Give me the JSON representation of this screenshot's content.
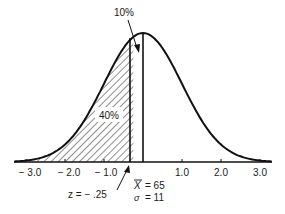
{
  "chart_data": {
    "type": "area",
    "title": "",
    "x_ticks": [
      "-3.0",
      "-2.0",
      "-1.0",
      "1.0",
      "2.0",
      "3.0"
    ],
    "x_tick_values": [
      -3,
      -2,
      -1,
      1,
      2,
      3
    ],
    "xlim": [
      -3.3,
      3.3
    ],
    "shaded_region": {
      "from": -3.3,
      "to": -0.25,
      "pattern": "hatched",
      "label": "40%"
    },
    "annotations": [
      {
        "text": "10%",
        "points_to": "area between z = -.25 and mean"
      },
      {
        "text": "z = − .25",
        "points_to": "z = -0.25 line"
      }
    ],
    "mean_line": 0,
    "cut_line": -0.25,
    "stats": {
      "mean_label": "X̄ = 65",
      "sigma_label": "σ = 11"
    }
  },
  "labels": {
    "top_pct": "10%",
    "shaded_pct": "40%",
    "z_value": "z  =  − .25",
    "xbar_symbol": "X",
    "xbar_value": "=  65",
    "sigma_symbol": "σ",
    "sigma_value": "=  11",
    "ticks": {
      "m3": "− 3.0",
      "m2": "− 2.0",
      "m1": "− 1.0",
      "p1": "1.0",
      "p2": "2.0",
      "p3": "3.0"
    }
  }
}
